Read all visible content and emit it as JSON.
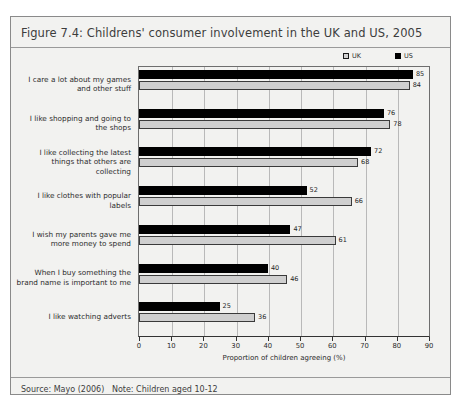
{
  "figure": {
    "title": "Figure 7.4: Childrens' consumer involvement in the UK and US, 2005",
    "footer": "Source: Mayo (2006)   Note: Children aged 10-12"
  },
  "legend": {
    "uk_label": "UK",
    "us_label": "US"
  },
  "colors": {
    "us_bar": "#000000",
    "uk_bar": "#cfcfcf",
    "panel_background": "#f2f2f0",
    "frame_border": "#8a8a8a",
    "gridline": "#b9b9b9",
    "axis": "#333333"
  },
  "chart_data": {
    "type": "bar",
    "orientation": "horizontal",
    "title": "Figure 7.4: Childrens' consumer involvement in the UK and US, 2005",
    "xlabel": "Proportion of children agreeing (%)",
    "ylabel": "",
    "xlim": [
      0,
      90
    ],
    "xticks": [
      0,
      10,
      20,
      30,
      40,
      50,
      60,
      70,
      80,
      90
    ],
    "grid": true,
    "legend_position": "top-right",
    "categories": [
      "I care a lot about my games and other stuff",
      "I like shopping and going to the shops",
      "I like collecting the latest things that others are collecting",
      "I like clothes with popular labels",
      "I wish my parents gave me more money to spend",
      "When I buy something the brand name is important to me",
      "I like watching adverts"
    ],
    "category_lines": [
      [
        "I care a lot about my games",
        "and other stuff"
      ],
      [
        "I like shopping and going to",
        "the shops"
      ],
      [
        "I like collecting the latest",
        "things that others are",
        "collecting"
      ],
      [
        "I like clothes with popular",
        "labels"
      ],
      [
        "I wish my parents gave me",
        "more money to spend"
      ],
      [
        "When I buy something the",
        "brand name is important to me"
      ],
      [
        "I like watching adverts"
      ]
    ],
    "series": [
      {
        "name": "US",
        "values": [
          85,
          76,
          72,
          52,
          47,
          40,
          25
        ]
      },
      {
        "name": "UK",
        "values": [
          84,
          78,
          68,
          66,
          61,
          46,
          36
        ]
      }
    ]
  }
}
